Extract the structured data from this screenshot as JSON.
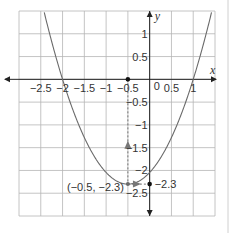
{
  "chart_data": {
    "type": "line",
    "title": "",
    "xlabel": "x",
    "ylabel": "y",
    "xlim": [
      -3,
      1.5
    ],
    "ylim": [
      -3,
      1.5
    ],
    "grid": true,
    "grid_step": 0.5,
    "x_tick_labels": [
      "-2.5",
      "-2",
      "-1.5",
      "-1",
      "-0.5",
      "0.5",
      "1"
    ],
    "x_tick_values": [
      -2.5,
      -2,
      -1.5,
      -1,
      -0.5,
      0.5,
      1
    ],
    "y_tick_labels": [
      "1",
      "0.5",
      "-0.5",
      "-1",
      "-1.5",
      "-2",
      "-2.5"
    ],
    "y_tick_values": [
      1,
      0.5,
      -0.5,
      -1,
      -1.5,
      -2,
      -2.5
    ],
    "origin_label": "0",
    "series": [
      {
        "name": "parabola",
        "equation": "y = 1.022(x + 0.5)^2 - 2.3",
        "vertex": [
          -0.5,
          -2.3
        ],
        "roots": [
          -2,
          1
        ],
        "a": 1.0222
      }
    ],
    "points": [
      {
        "x": -0.5,
        "y": 0,
        "label": ""
      },
      {
        "x": -0.5,
        "y": -2.3,
        "label": "(−0.5, −2.3)"
      },
      {
        "x": 0,
        "y": -2.3,
        "label": "−2.3"
      }
    ],
    "annotations": {
      "vertex_label": "(−0.5, −2.3)",
      "y_intercept_line_label": "−2.3"
    }
  },
  "colors": {
    "grid": "#b5b5b5",
    "axis": "#222222",
    "curve": "#6a6a6a",
    "dashed": "#777777",
    "border": "#d0d0d0"
  }
}
